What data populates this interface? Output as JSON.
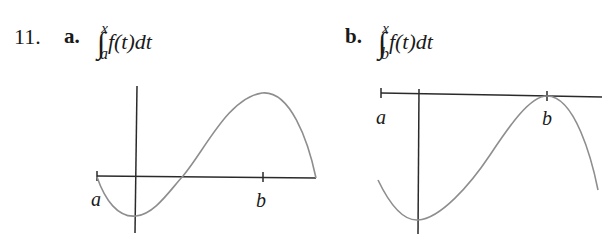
{
  "problem": {
    "number": "11.",
    "parts": [
      {
        "label": "a.",
        "integral": {
          "sign": "∫",
          "upper": "x",
          "lower": "a",
          "body": "f(t)dt"
        },
        "graph": {
          "tick_labels": [
            "a",
            "b"
          ],
          "description": "x-axis with ticks at a and b; curve starts at a on axis, dips below to minimum near y-axis, crosses up, peaks above b, returns to axis at right end"
        }
      },
      {
        "label": "b.",
        "integral": {
          "sign": "∫",
          "upper": "x",
          "lower": "b",
          "body": "f(t)dt"
        },
        "graph": {
          "tick_labels": [
            "a",
            "b"
          ],
          "description": "x-axis at top with ticks at a and b; curve entirely below axis, minimum near y-axis, rises to touch axis at b, then falls"
        }
      }
    ]
  }
}
